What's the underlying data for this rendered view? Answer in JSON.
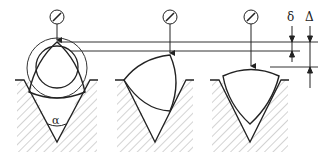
{
  "diagram": {
    "labels": {
      "angle": "α",
      "delta_small": "δ",
      "delta_large": "Δ"
    },
    "views": [
      {
        "id": "round-with-lobed-overlay",
        "gauge": "dial-indicator-icon",
        "groove": "v-block"
      },
      {
        "id": "tri-lobed-rotated",
        "gauge": "dial-indicator-icon",
        "groove": "v-block"
      },
      {
        "id": "tri-lobed-upright",
        "gauge": "dial-indicator-icon",
        "groove": "v-block"
      }
    ],
    "colors": {
      "line": "#222222",
      "hatch": "#9a9a9a",
      "background": "#ffffff"
    }
  }
}
